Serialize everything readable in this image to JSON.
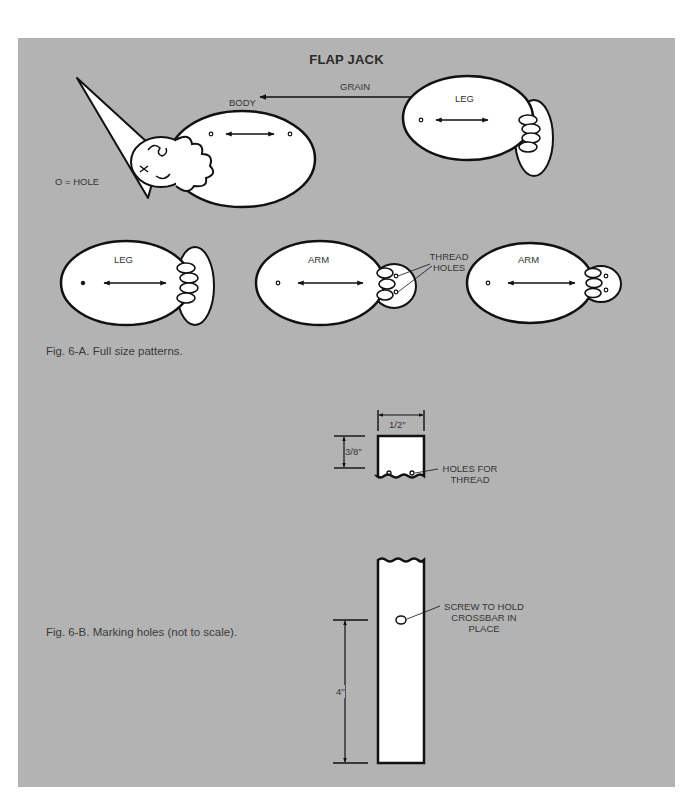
{
  "figure": {
    "title": "FLAP JACK",
    "grain_label": "GRAIN",
    "hole_legend": "O = HOLE",
    "patterns": [
      {
        "label": "BODY"
      },
      {
        "label": "LEG"
      },
      {
        "label": "LEG"
      },
      {
        "label": "ARM"
      },
      {
        "label": "ARM"
      }
    ],
    "thread_holes_label_line1": "THREAD",
    "thread_holes_label_line2": "HOLES",
    "caption_a": "Fig. 6-A.  Full size patterns.",
    "caption_b": "Fig. 6-B.  Marking holes (not to scale).",
    "dimensions": {
      "width": "1/2′′",
      "hole_offset": "3/8′′",
      "screw_offset": "4′′"
    },
    "callouts": {
      "holes_for_thread_line1": "HOLES FOR",
      "holes_for_thread_line2": "THREAD",
      "screw_line1": "SCREW TO HOLD",
      "screw_line2": "CROSSBAR IN",
      "screw_line3": "PLACE"
    }
  },
  "colors": {
    "panel": "#b3b3b3",
    "ink": "#111111",
    "paper": "#ffffff"
  }
}
